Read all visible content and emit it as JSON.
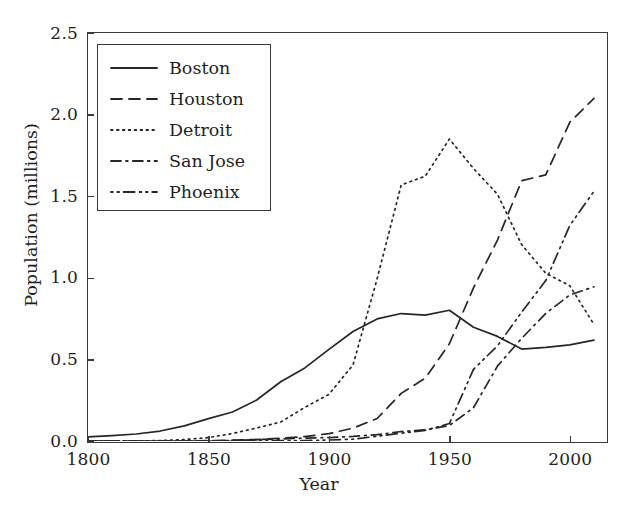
{
  "chart_data": {
    "type": "line",
    "title": "",
    "xlabel": "Year",
    "ylabel": "Population (millions)",
    "xlim": [
      1800,
      2015
    ],
    "ylim": [
      0.0,
      2.5
    ],
    "grid": false,
    "legend_position": "upper left",
    "xticks": [
      1800,
      1850,
      1900,
      1950,
      2000
    ],
    "xtick_labels": [
      "1800",
      "1850",
      "1900",
      "1950",
      "2000"
    ],
    "yticks": [
      0.0,
      0.5,
      1.0,
      1.5,
      2.0,
      2.5
    ],
    "ytick_labels": [
      "0.0",
      "0.5",
      "1.0",
      "1.5",
      "2.0",
      "2.5"
    ],
    "x": [
      1800,
      1810,
      1820,
      1830,
      1840,
      1850,
      1860,
      1870,
      1880,
      1890,
      1900,
      1910,
      1920,
      1930,
      1940,
      1950,
      1960,
      1970,
      1980,
      1990,
      2000,
      2010
    ],
    "series": [
      {
        "name": "Boston",
        "dash": "solid",
        "color": "#262626",
        "values": [
          0.025,
          0.033,
          0.043,
          0.061,
          0.093,
          0.137,
          0.178,
          0.251,
          0.363,
          0.448,
          0.561,
          0.671,
          0.748,
          0.781,
          0.771,
          0.801,
          0.697,
          0.641,
          0.563,
          0.574,
          0.589,
          0.618
        ]
      },
      {
        "name": "Houston",
        "dash": "dashed",
        "color": "#262626",
        "values": [
          0.0,
          0.0,
          0.0,
          0.0,
          0.0,
          0.002,
          0.005,
          0.009,
          0.017,
          0.027,
          0.045,
          0.079,
          0.138,
          0.292,
          0.385,
          0.596,
          0.938,
          1.233,
          1.595,
          1.631,
          1.954,
          2.099
        ]
      },
      {
        "name": "Detroit",
        "dash": "dotted",
        "color": "#262626",
        "values": [
          0.0,
          0.001,
          0.001,
          0.002,
          0.009,
          0.021,
          0.046,
          0.08,
          0.116,
          0.206,
          0.286,
          0.466,
          0.994,
          1.569,
          1.623,
          1.85,
          1.67,
          1.511,
          1.203,
          1.028,
          0.951,
          0.714
        ]
      },
      {
        "name": "San Jose",
        "dash": "dashdot",
        "color": "#262626",
        "values": [
          0.0,
          0.0,
          0.0,
          0.0,
          0.0,
          0.0,
          0.003,
          0.009,
          0.012,
          0.018,
          0.021,
          0.028,
          0.039,
          0.058,
          0.068,
          0.095,
          0.204,
          0.46,
          0.629,
          0.782,
          0.895,
          0.945
        ]
      },
      {
        "name": "Phoenix",
        "dash": "dashdotdot",
        "color": "#262626",
        "values": [
          0.0,
          0.0,
          0.0,
          0.0,
          0.0,
          0.0,
          0.0,
          0.001,
          0.002,
          0.003,
          0.006,
          0.011,
          0.029,
          0.048,
          0.065,
          0.107,
          0.439,
          0.584,
          0.79,
          0.983,
          1.321,
          1.53
        ]
      }
    ]
  }
}
